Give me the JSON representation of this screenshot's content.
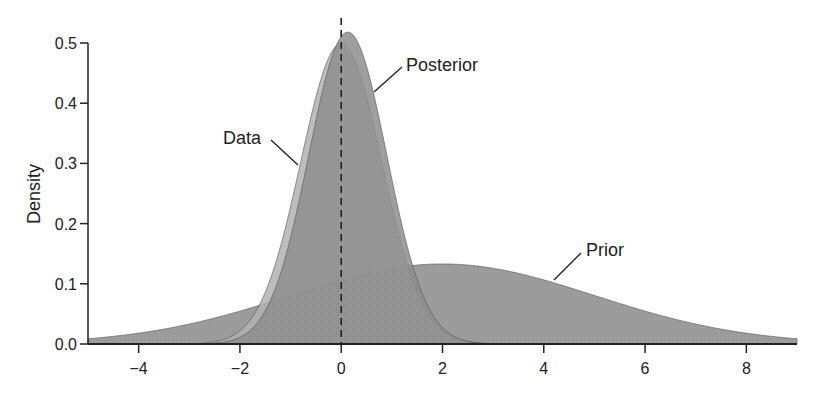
{
  "chart_data": {
    "type": "area",
    "title": "",
    "xlabel": "",
    "ylabel": "Density",
    "xlim": [
      -5,
      9
    ],
    "ylim": [
      0,
      0.5
    ],
    "x_ticks": [
      -4,
      -2,
      0,
      2,
      4,
      6,
      8
    ],
    "x_tick_labels": [
      "−4",
      "−2",
      "0",
      "2",
      "4",
      "6",
      "8"
    ],
    "y_ticks": [
      0.0,
      0.1,
      0.2,
      0.3,
      0.4,
      0.5
    ],
    "y_tick_labels": [
      "0.0",
      "0.1",
      "0.2",
      "0.3",
      "0.4",
      "0.5"
    ],
    "grid": false,
    "legend": "none (direct annotations)",
    "reference_line": {
      "x": 0,
      "style": "dashed",
      "color": "#222222"
    },
    "series": [
      {
        "name": "Prior",
        "distribution": "normal",
        "mean": 2.0,
        "sd": 3.0,
        "peak_density": 0.133,
        "fill": "#8c8c8c",
        "opacity": 0.85
      },
      {
        "name": "Data",
        "distribution": "normal",
        "mean": 0.0,
        "sd": 0.8,
        "peak_density": 0.5,
        "fill": "#b4b4b4",
        "opacity": 0.85
      },
      {
        "name": "Posterior",
        "distribution": "normal",
        "mean": 0.13,
        "sd": 0.77,
        "peak_density": 0.516,
        "fill": "#8f8f8f",
        "opacity": 0.85
      }
    ],
    "annotations": [
      {
        "text": "Posterior",
        "x": 0.75,
        "y": 0.46
      },
      {
        "text": "Data",
        "x": -1.0,
        "y": 0.3
      },
      {
        "text": "Prior",
        "x": 4.6,
        "y": 0.11
      }
    ]
  },
  "labels": {
    "ylabel": "Density",
    "posterior": "Posterior",
    "data": "Data",
    "prior": "Prior"
  }
}
